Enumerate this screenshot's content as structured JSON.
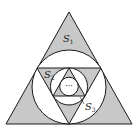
{
  "figure": {
    "labels": {
      "s1": {
        "main": "S",
        "sub": "1"
      },
      "s2": {
        "main": "S",
        "sub": "2"
      },
      "s3": {
        "main": "S",
        "sub": "3"
      },
      "ellipsis": "···"
    },
    "colors": {
      "shade": "#c8c8c8",
      "stroke": "#1a1a1a",
      "background": "#ffffff"
    }
  }
}
